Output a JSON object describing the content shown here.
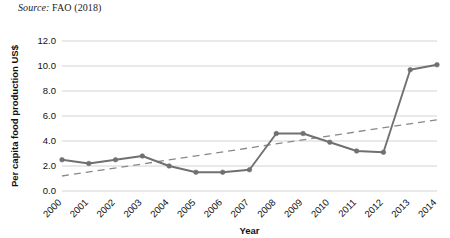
{
  "source_note": {
    "label": "Source:",
    "text": "FAO (2018)"
  },
  "chart_data": {
    "type": "line",
    "title": "",
    "subtitle": "",
    "xlabel": "Year",
    "ylabel": "Per capita food production US$",
    "categories": [
      "2000",
      "2001",
      "2002",
      "2003",
      "2004",
      "2005",
      "2006",
      "2007",
      "2008",
      "2009",
      "2010",
      "2011",
      "2012",
      "2013",
      "2014"
    ],
    "values": [
      2.5,
      2.2,
      2.5,
      2.8,
      2.0,
      1.5,
      1.5,
      1.7,
      4.6,
      4.6,
      3.9,
      3.2,
      3.1,
      9.7,
      10.1
    ],
    "series": [
      {
        "name": "Per capita food production US$",
        "values": [
          2.5,
          2.2,
          2.5,
          2.8,
          2.0,
          1.5,
          1.5,
          1.7,
          4.6,
          4.6,
          3.9,
          3.2,
          3.1,
          9.7,
          10.1
        ],
        "style": "solid-with-markers",
        "color": "#707070"
      },
      {
        "name": "Linear trend",
        "style": "dashed",
        "color": "#888888",
        "endpoints": [
          {
            "x": "2000",
            "y": 1.2
          },
          {
            "x": "2014",
            "y": 5.7
          }
        ]
      }
    ],
    "ylim": [
      0.0,
      12.0
    ],
    "ytick_values": [
      "0.0",
      "2.0",
      "4.0",
      "6.0",
      "8.0",
      "10.0",
      "12.0"
    ],
    "ytick_numeric": [
      0.0,
      2.0,
      4.0,
      6.0,
      8.0,
      10.0,
      12.0
    ],
    "grid": true,
    "grid_axis": "y",
    "legend": false,
    "legend_position": "none",
    "xtick_rotation": 45
  }
}
